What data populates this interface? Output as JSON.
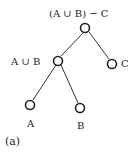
{
  "diagram": {
    "type": "expression-tree",
    "nodes": [
      {
        "id": "root",
        "label": "(A ∪ B) − C"
      },
      {
        "id": "union",
        "label": "A ∪ B"
      },
      {
        "id": "c",
        "label": "C"
      },
      {
        "id": "a",
        "label": "A"
      },
      {
        "id": "b",
        "label": "B"
      }
    ],
    "edges": [
      {
        "from": "root",
        "to": "union"
      },
      {
        "from": "root",
        "to": "c"
      },
      {
        "from": "union",
        "to": "a"
      },
      {
        "from": "union",
        "to": "b"
      }
    ],
    "caption": "(a)"
  }
}
